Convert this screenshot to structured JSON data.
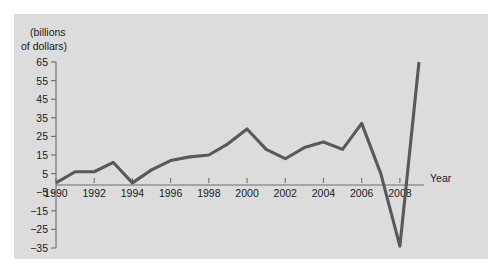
{
  "figure": {
    "background_color": "#dcdcdc",
    "page_background_color": "#ffffff",
    "axis_color": "#6d6d6d",
    "line_color": "#59595b"
  },
  "axis_titles": {
    "y_line1": "(billions",
    "y_line2": "of dollars)",
    "x": "Year"
  },
  "chart_data": {
    "type": "line",
    "title": "",
    "subtitle": "",
    "xlabel": "Year",
    "ylabel": "(billions of dollars)",
    "x": [
      1990,
      1991,
      1992,
      1993,
      1994,
      1995,
      1996,
      1997,
      1998,
      1999,
      2000,
      2001,
      2002,
      2003,
      2004,
      2005,
      2006,
      2007,
      2008,
      2009
    ],
    "values": [
      0,
      6,
      6,
      11,
      0,
      7,
      12,
      14,
      15,
      21,
      29,
      18,
      13,
      19,
      22,
      18,
      32,
      5,
      -34,
      65
    ],
    "series": [
      {
        "name": "",
        "values": [
          0,
          6,
          6,
          11,
          0,
          7,
          12,
          14,
          15,
          21,
          29,
          18,
          13,
          19,
          22,
          18,
          32,
          5,
          -34,
          65
        ]
      }
    ],
    "xlim": [
      1990,
      2009
    ],
    "ylim": [
      -35,
      65
    ],
    "y_ticks": [
      65,
      55,
      45,
      35,
      25,
      15,
      5,
      -5,
      -15,
      -25,
      -35
    ],
    "y_tick_labels": [
      "65",
      "55",
      "45",
      "35",
      "25",
      "15",
      "5",
      "−5",
      "−15",
      "−25",
      "−35"
    ],
    "x_ticks": [
      1990,
      1992,
      1994,
      1996,
      1998,
      2000,
      2002,
      2004,
      2006,
      2008
    ],
    "x_tick_labels": [
      "1990",
      "1992",
      "1994",
      "1996",
      "1998",
      "2000",
      "2002",
      "2004",
      "2006",
      "2008"
    ],
    "grid": false,
    "legend": "none",
    "baseline_value": 0
  }
}
